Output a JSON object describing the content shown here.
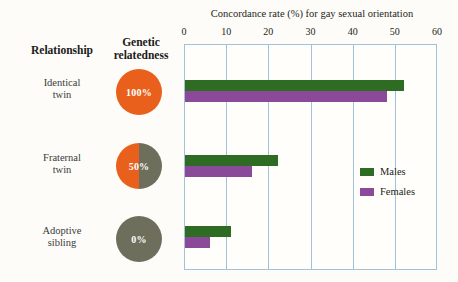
{
  "chart_data": {
    "type": "bar",
    "orientation": "horizontal",
    "title": "Concordance rate (%) for gay sexual orientation",
    "xlabel": "Concordance rate (%) for gay sexual orientation",
    "ylabel": "Relationship",
    "categories": [
      "Identical twin",
      "Fraternal twin",
      "Adoptive sibling"
    ],
    "series": [
      {
        "name": "Males",
        "color": "#2e6b23",
        "values": [
          52,
          22,
          11
        ]
      },
      {
        "name": "Females",
        "color": "#8a4a99",
        "values": [
          48,
          16,
          6
        ]
      }
    ],
    "xlim": [
      0,
      60
    ],
    "xticks": [
      0,
      10,
      20,
      30,
      40,
      50,
      60
    ],
    "grid": true,
    "legend_position": "middle-right",
    "annotations": [
      {
        "label": "Genetic relatedness",
        "values": [
          "100%",
          "50%",
          "0%"
        ]
      }
    ]
  },
  "table": {
    "headers": {
      "relationship": "Relationship",
      "relatedness_line1": "Genetic",
      "relatedness_line2": "relatedness"
    },
    "rows": [
      {
        "label_line1": "Identical",
        "label_line2": "twin",
        "relatedness_text": "100%",
        "relatedness_percent": 100
      },
      {
        "label_line1": "Fraternal",
        "label_line2": "twin",
        "relatedness_text": "50%",
        "relatedness_percent": 50
      },
      {
        "label_line1": "Adoptive",
        "label_line2": "sibling",
        "relatedness_text": "0%",
        "relatedness_percent": 0
      }
    ]
  },
  "colors": {
    "shared_genes": "#e8601c",
    "unshared_genes": "#6d6e5b",
    "males": "#2e6b23",
    "females": "#8a4a99",
    "gridline": "#9fc3dd",
    "background": "#fdfcf8"
  },
  "legend": {
    "items": [
      {
        "label": "Males",
        "color": "#2e6b23"
      },
      {
        "label": "Females",
        "color": "#8a4a99"
      }
    ]
  },
  "axis": {
    "title": "Concordance rate (%) for gay sexual orientation",
    "ticks": [
      "0",
      "10",
      "20",
      "30",
      "40",
      "50",
      "60"
    ]
  }
}
